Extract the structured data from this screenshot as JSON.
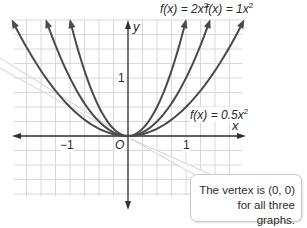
{
  "chart_data": {
    "type": "line",
    "title": "",
    "xlabel": "x",
    "ylabel": "y",
    "xlim": [
      -2,
      2
    ],
    "ylim": [
      -1.05,
      2
    ],
    "grid": true,
    "grid_step": 0.25,
    "x_ticks": [
      {
        "value": -1,
        "label": "−1"
      },
      {
        "value": 1,
        "label": "1"
      }
    ],
    "y_ticks": [
      {
        "value": 1,
        "label": "1"
      }
    ],
    "origin_label": "O",
    "series": [
      {
        "name": "f(x) = 2x²",
        "a": 2,
        "color": "#4a4a4a"
      },
      {
        "name": "f(x) = 1x²",
        "a": 1,
        "color": "#4a4a4a"
      },
      {
        "name": "f(x) = 0.5x²",
        "a": 0.5,
        "color": "#4a4a4a"
      }
    ],
    "annotations": [
      {
        "text": "The vertex is (0, 0) for all three graphs.",
        "points_to": [
          0,
          0
        ]
      }
    ]
  },
  "labels": {
    "f2": {
      "prefix": "f(x) = 2x",
      "sup": "2"
    },
    "f1": {
      "prefix": "f(x) = 1x",
      "sup": "2"
    },
    "f05": {
      "prefix": "f(x) = 0.5x",
      "sup": "2"
    },
    "x_axis": "x",
    "y_axis": "y",
    "tick_neg1": "−1",
    "tick_pos1_x": "1",
    "tick_pos1_y": "1",
    "origin": "O",
    "callout_line1": "The vertex is (0, 0)",
    "callout_line2": "for all three graphs."
  },
  "colors": {
    "grid": "#d8d8d8",
    "axis": "#333333",
    "curve": "#4a4a4a",
    "pointer": "#d6d6d6"
  }
}
